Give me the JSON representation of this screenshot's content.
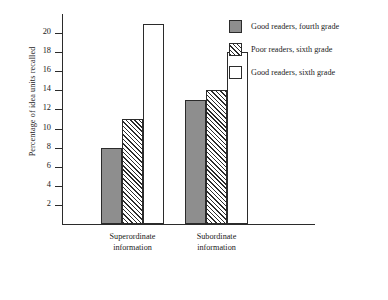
{
  "chart_data": {
    "type": "bar",
    "title": "",
    "xlabel": "",
    "ylabel": "Percentage of idea units recalled",
    "categories": [
      "Superordinate information",
      "Subordinate information"
    ],
    "category_lines": [
      [
        "Superordinate",
        "information"
      ],
      [
        "Subordinate",
        "information"
      ]
    ],
    "series": [
      {
        "name": "Good readers, fourth grade",
        "values": [
          8,
          13
        ],
        "fill": "solid"
      },
      {
        "name": "Poor readers, sixth grade",
        "values": [
          11,
          14
        ],
        "fill": "hatch"
      },
      {
        "name": "Good readers, sixth grade",
        "values": [
          21,
          18
        ],
        "fill": "open"
      }
    ],
    "ylim": [
      0,
      22
    ],
    "yticks": [
      2,
      4,
      6,
      8,
      10,
      12,
      14,
      16,
      18,
      20
    ],
    "ytick_labels": [
      "2",
      "4",
      "6",
      "8",
      "10",
      "12",
      "14",
      "16",
      "18",
      "20"
    ],
    "grid": false,
    "legend_position": "top-right"
  },
  "colors": {
    "solid_fill": "#8e8e8e",
    "open_fill": "#ffffff",
    "line": "#2b2b2b",
    "background": "#ffffff"
  }
}
